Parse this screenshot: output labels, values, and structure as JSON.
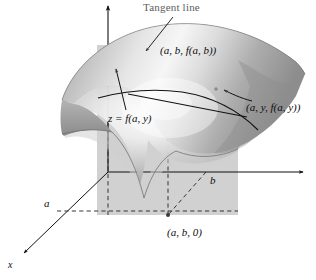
{
  "figure": {
    "type": "3d-surface-diagram",
    "axes": {
      "z_axis": {
        "name": "z-axis",
        "label": "",
        "direction": "up",
        "arrow": true
      },
      "y_axis": {
        "name": "y-axis",
        "label": "",
        "direction": "right",
        "arrow": true
      },
      "x_axis": {
        "name": "x-axis",
        "label": "x",
        "direction": "down-left",
        "arrow": true
      }
    },
    "labels": {
      "tangent_line": "Tangent line",
      "point_surface": "(a, b, f(a, b))",
      "point_curve": "(a, y, f(a, y))",
      "curve_equation": "z = f(a, y)",
      "point_base": "(a, b, 0)",
      "axis_a": "a",
      "axis_b": "b",
      "axis_x": "x"
    },
    "colors": {
      "surface_light": "#f2f2f2",
      "surface_mid": "#b9b9b9",
      "surface_dark": "#8f8f8f",
      "surface_underside": "#9a9a9a",
      "plane_fill": "#cfcfcf",
      "line": "#111111",
      "tangent_label": "#5d5d5d",
      "background": "#ffffff"
    },
    "elements": [
      {
        "name": "vertical-plane",
        "description": "translucent grey plane x = a"
      },
      {
        "name": "saddle-surface",
        "description": "shaded curved surface z = f(x, y)"
      },
      {
        "name": "trace-curve",
        "description": "curve of intersection z = f(a, y)"
      },
      {
        "name": "tangent-line",
        "description": "straight tangent line at (a, b, f(a, b))"
      },
      {
        "name": "dashed-guides",
        "description": "dashed projection lines to base point"
      }
    ]
  }
}
